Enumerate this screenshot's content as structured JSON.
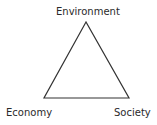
{
  "diagram": {
    "type": "triangle",
    "vertices": {
      "top": "Environment",
      "bottom_left": "Economy",
      "bottom_right": "Society"
    },
    "line_color": "#333333"
  }
}
